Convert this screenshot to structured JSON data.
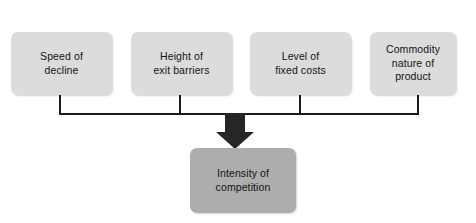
{
  "diagram": {
    "background_color": "#ffffff",
    "factor_box_color": "#dcdcdc",
    "outcome_box_color": "#adadad",
    "line_color": "#1a1a1a",
    "arrow_color": "#262626",
    "text_color": "#141414",
    "factors": [
      {
        "id": "speed-of-decline",
        "label": "Speed of\ndecline",
        "x": 11,
        "y": 32,
        "width": 101,
        "height": 63,
        "stub_x": 60
      },
      {
        "id": "height-of-exit-barriers",
        "label": "Height of\nexit barriers",
        "x": 131,
        "y": 32,
        "width": 101,
        "height": 63,
        "stub_x": 180
      },
      {
        "id": "level-of-fixed-costs",
        "label": "Level of\nfixed costs",
        "x": 250,
        "y": 32,
        "width": 101,
        "height": 63,
        "stub_x": 300
      },
      {
        "id": "commodity-nature-of-product",
        "label": "Commodity\nnature of\nproduct",
        "x": 370,
        "y": 32,
        "width": 86,
        "height": 63,
        "stub_x": 418
      }
    ],
    "outcome": {
      "id": "intensity-of-competition",
      "label": "Intensity of\ncompetition",
      "x": 190,
      "y": 148,
      "width": 106,
      "height": 65
    },
    "bus": {
      "y": 114,
      "x_start": 60,
      "x_end": 418,
      "stroke_width": 2
    },
    "arrow": {
      "id": "down-arrow",
      "center_x": 235,
      "top_y": 114,
      "tip_y": 149,
      "shaft_width": 20,
      "head_width": 38,
      "head_height": 17
    }
  }
}
